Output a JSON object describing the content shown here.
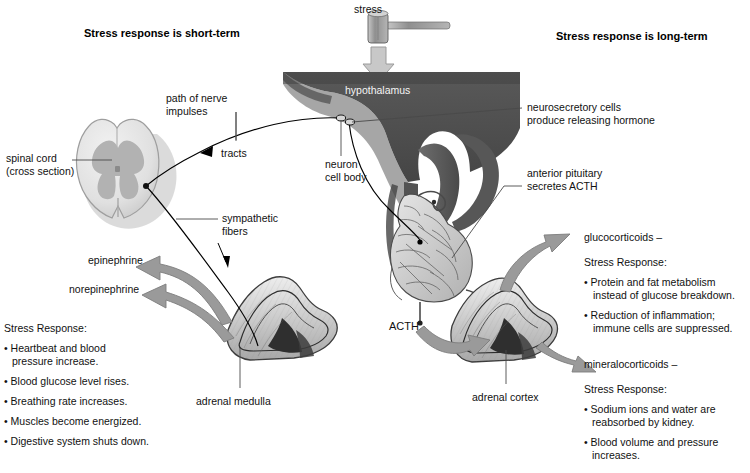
{
  "figure": {
    "type": "biology-diagram",
    "background": "#ffffff"
  },
  "colors": {
    "text": "#111111",
    "leader_line": "#555555",
    "nerve_line": "#000000",
    "hormone_arrow": "#9a9a9a",
    "hormone_arrow_edge": "#7d7d7d",
    "brain_dark": "#4c4c4c",
    "brain_mid": "#636363",
    "brain_light": "#7d7d7d",
    "cord_outer": "#e2e2e2",
    "cord_gray_matter": "#b4b4b4",
    "gland_light": "#d8d8d8",
    "gland_dark": "#3a3a3a",
    "mallet": "#9e9e9e"
  },
  "headings": {
    "left": "Stress response is short-term",
    "right": "Stress response is long-term"
  },
  "labels": {
    "stress": "stress",
    "hypothalamus": "hypothalamus",
    "path_of_nerve_impulses": "path of nerve\nimpulses",
    "tracts": "tracts",
    "spinal_cord": "spinal cord\n(cross section)",
    "sympathetic_fibers": "sympathetic\nfibers",
    "neuron_cell_body": "neuron\ncell body",
    "neurosecretory_cells": "neurosecretory cells\nproduce releasing hormone",
    "anterior_pituitary": "anterior pituitary\nsecretes ACTH",
    "acth": "ACTH",
    "epinephrine": "epinephrine",
    "norepinephrine": "norepinephrine",
    "adrenal_medulla": "adrenal medulla",
    "adrenal_cortex": "adrenal cortex",
    "glucocorticoids": "glucocorticoids –",
    "mineralocorticoids": "mineralocorticoids –"
  },
  "panels": {
    "short_term": {
      "title": "Stress Response:",
      "items": [
        "Heartbeat and blood\npressure increase.",
        "Blood glucose level rises.",
        "Breathing rate increases.",
        "Muscles become energized.",
        "Digestive system shuts down."
      ]
    },
    "glucocorticoids": {
      "title": "Stress Response:",
      "items": [
        "Protein and fat metabolism\ninstead of glucose breakdown.",
        "Reduction of inflammation;\nimmune cells are suppressed."
      ]
    },
    "mineralocorticoids": {
      "title": "Stress Response:",
      "items": [
        "Sodium ions and water are\nreabsorbed by kidney.",
        "Blood volume and pressure\nincreases."
      ]
    }
  }
}
